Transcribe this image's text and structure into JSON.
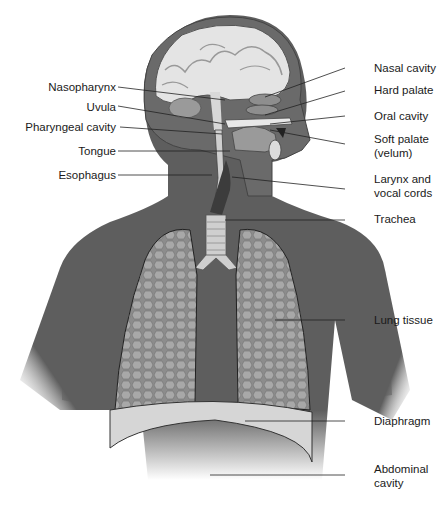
{
  "figure": {
    "colors": {
      "body": "#5e5e5e",
      "body_dark": "#4c4c4c",
      "lung": "#8c8c8c",
      "lung_cell": "#b8b8b8",
      "trachea": "#cfcfcf",
      "diaphragm": "#d6d6d6",
      "brain": "#e4e4e4",
      "label_text": "#1a1a1a",
      "leader_line": "#222222"
    }
  },
  "labels": {
    "left": [
      {
        "id": "nasopharynx",
        "text": "Nasopharynx"
      },
      {
        "id": "uvula",
        "text": "Uvula"
      },
      {
        "id": "pharyngeal-cavity",
        "text": "Pharyngeal cavity"
      },
      {
        "id": "tongue",
        "text": "Tongue"
      },
      {
        "id": "esophagus",
        "text": "Esophagus"
      }
    ],
    "right": [
      {
        "id": "nasal-cavity",
        "line1": "Nasal cavity",
        "line2": ""
      },
      {
        "id": "hard-palate",
        "line1": "Hard palate",
        "line2": ""
      },
      {
        "id": "oral-cavity",
        "line1": "Oral cavity",
        "line2": ""
      },
      {
        "id": "soft-palate",
        "line1": "Soft palate",
        "line2": "(velum)"
      },
      {
        "id": "larynx",
        "line1": "Larynx and",
        "line2": "vocal cords"
      },
      {
        "id": "trachea",
        "line1": "Trachea",
        "line2": ""
      },
      {
        "id": "lung-tissue",
        "line1": "Lung tissue",
        "line2": ""
      },
      {
        "id": "diaphragm",
        "line1": "Diaphragm",
        "line2": ""
      },
      {
        "id": "abdominal-cavity",
        "line1": "Abdominal",
        "line2": "cavity"
      }
    ]
  }
}
